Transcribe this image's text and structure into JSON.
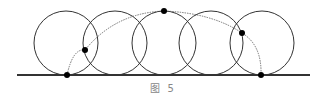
{
  "figure": {
    "caption": "图 5",
    "stroke_color": "#333333",
    "curve_color": "#555555",
    "point_color": "#000000"
  },
  "diagram": {
    "baseline": {
      "x1": 17,
      "x2": 310,
      "y": 75
    },
    "circles": [
      {
        "cx": 66,
        "cy": 43,
        "r": 32
      },
      {
        "cx": 115,
        "cy": 43,
        "r": 32
      },
      {
        "cx": 164,
        "cy": 43,
        "r": 32
      },
      {
        "cx": 211,
        "cy": 43,
        "r": 32
      },
      {
        "cx": 262,
        "cy": 43,
        "r": 32
      }
    ],
    "points": [
      {
        "x": 67,
        "y": 75
      },
      {
        "x": 85,
        "y": 50
      },
      {
        "x": 164,
        "y": 11
      },
      {
        "x": 242,
        "y": 33
      },
      {
        "x": 261,
        "y": 75
      }
    ]
  }
}
